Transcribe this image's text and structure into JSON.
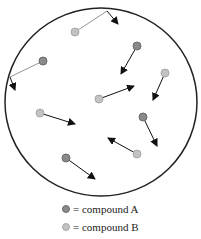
{
  "colors": {
    "compound_a": "#8a8a8a",
    "compound_a_border": "#6a6a6a",
    "compound_b": "#c2c2c2",
    "compound_b_border": "#a8a8a8",
    "container": "#222222",
    "arrow": "#111111",
    "trail": "#888888"
  },
  "container": {
    "cx": 101,
    "cy": 102,
    "rx": 96,
    "ry": 94
  },
  "particles": [
    {
      "type": "B",
      "x": 75,
      "y": 32,
      "path": [
        [
          75,
          32
        ],
        [
          107,
          11
        ],
        [
          118,
          24
        ]
      ]
    },
    {
      "type": "A",
      "x": 43,
      "y": 61,
      "path": [
        [
          43,
          61
        ],
        [
          10,
          77
        ],
        [
          15,
          90
        ]
      ]
    },
    {
      "type": "A",
      "x": 137,
      "y": 46,
      "path": [
        [
          137,
          46
        ],
        [
          121,
          74
        ]
      ]
    },
    {
      "type": "B",
      "x": 165,
      "y": 73,
      "path": [
        [
          165,
          73
        ],
        [
          153,
          100
        ]
      ]
    },
    {
      "type": "B",
      "x": 99,
      "y": 99,
      "path": [
        [
          99,
          99
        ],
        [
          134,
          86
        ]
      ]
    },
    {
      "type": "B",
      "x": 40,
      "y": 113,
      "path": [
        [
          40,
          113
        ],
        [
          75,
          124
        ]
      ]
    },
    {
      "type": "A",
      "x": 143,
      "y": 117,
      "path": [
        [
          143,
          117
        ],
        [
          157,
          146
        ]
      ]
    },
    {
      "type": "B",
      "x": 137,
      "y": 154,
      "path": [
        [
          137,
          154
        ],
        [
          108,
          138
        ]
      ]
    },
    {
      "type": "A",
      "x": 66,
      "y": 158,
      "path": [
        [
          66,
          158
        ],
        [
          95,
          179
        ]
      ]
    }
  ],
  "legend": [
    {
      "type": "A",
      "label": "= compound A"
    },
    {
      "type": "B",
      "label": "= compound B"
    }
  ]
}
